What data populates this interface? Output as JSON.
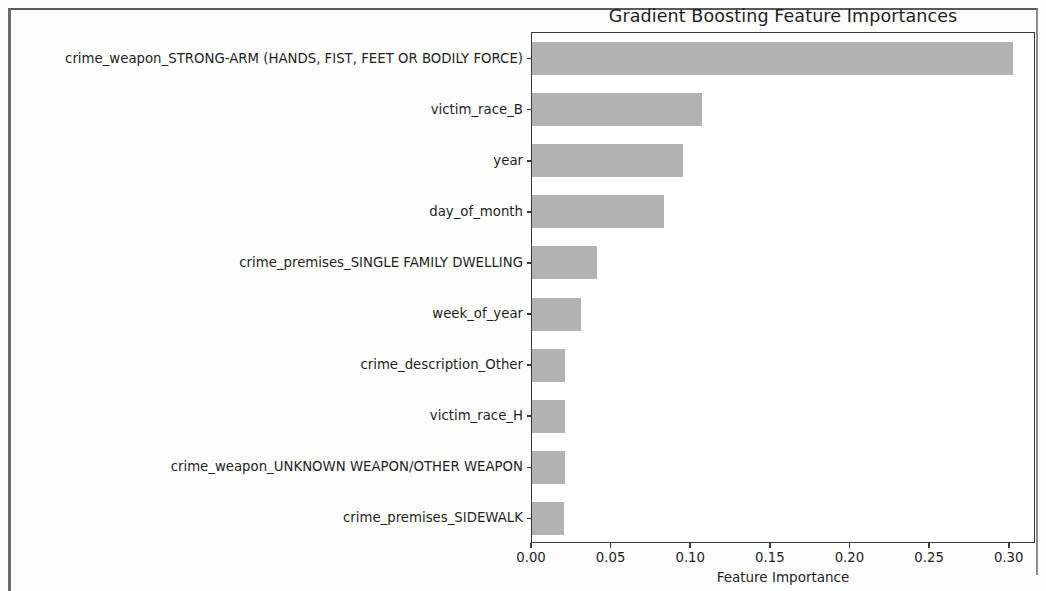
{
  "figure": {
    "title": "Gradient Boosting Feature Importances"
  },
  "chart_data": {
    "type": "bar",
    "orientation": "horizontal",
    "title": "Gradient Boosting Feature Importances",
    "xlabel": "Feature Importance",
    "ylabel": "",
    "xlim": [
      0.0,
      0.3165
    ],
    "xticks": [
      0.0,
      0.05,
      0.1,
      0.15,
      0.2,
      0.25,
      0.3
    ],
    "xticklabels": [
      "0.00",
      "0.05",
      "0.10",
      "0.15",
      "0.20",
      "0.25",
      "0.30"
    ],
    "grid": false,
    "legend": null,
    "bar_color": "#b2b2b2",
    "categories": [
      "crime_weapon_STRONG-ARM (HANDS, FIST, FEET OR BODILY FORCE)",
      "victim_race_B",
      "year",
      "day_of_month",
      "crime_premises_SINGLE FAMILY DWELLING",
      "week_of_year",
      "crime_description_Other",
      "victim_race_H",
      "crime_weapon_UNKNOWN WEAPON/OTHER WEAPON",
      "crime_premises_SIDEWALK"
    ],
    "values": [
      0.302,
      0.107,
      0.095,
      0.083,
      0.041,
      0.031,
      0.021,
      0.021,
      0.021,
      0.02
    ]
  }
}
